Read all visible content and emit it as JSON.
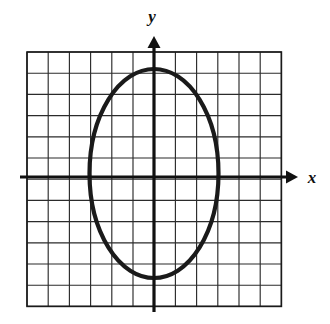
{
  "figure": {
    "background_color": "#ffffff"
  },
  "axes": {
    "x_label": "x",
    "y_label": "y",
    "axis_color": "#111111",
    "axis_line_width": 3.2,
    "x_axis_y_px": 177,
    "y_axis_x_px": 154,
    "x_arrow_tip_px": 298,
    "y_arrow_tip_px": 36,
    "x_label_pos": {
      "x": 312,
      "y": 183
    },
    "y_label_pos": {
      "x": 152,
      "y": 22
    }
  },
  "grid": {
    "columns": 12,
    "rows": 12,
    "cell_size_px": 21.2,
    "origin_col_index": 6,
    "origin_row_index": 6,
    "left_px": 27,
    "top_px": 52,
    "right_px": 281.4,
    "bottom_px": 306.4,
    "line_color": "#2b2b2b",
    "line_width": 1.15,
    "border_color": "#1a1a1a",
    "border_width": 1.6
  },
  "chart_data": {
    "type": "line",
    "xlabel": "x",
    "ylabel": "y",
    "grid": true,
    "legend": "none",
    "xlim": [
      -6,
      6
    ],
    "ylim": [
      -6,
      6
    ],
    "curves": [
      {
        "name": "ellipse",
        "shape": "ellipse",
        "center": [
          0,
          0
        ],
        "semi_axis_x": 3,
        "semi_axis_y": 5,
        "equation": "x^2/9 + y^2/25 = 1",
        "stroke_color": "#1a1a1a",
        "stroke_width": 4.2,
        "vertices": [
          [
            0,
            5
          ],
          [
            0,
            -5
          ]
        ],
        "co_vertices": [
          [
            -3,
            0
          ],
          [
            3,
            0
          ]
        ],
        "pixel_center": [
          154,
          173.5
        ],
        "pixel_semi_axis_x": 64.5,
        "pixel_semi_axis_y": 104.5
      }
    ],
    "x_ticks": [
      -6,
      -5,
      -4,
      -3,
      -2,
      -1,
      0,
      1,
      2,
      3,
      4,
      5,
      6
    ],
    "y_ticks": [
      -6,
      -5,
      -4,
      -3,
      -2,
      -1,
      0,
      1,
      2,
      3,
      4,
      5,
      6
    ],
    "x_tick_labels": [],
    "y_tick_labels": []
  }
}
